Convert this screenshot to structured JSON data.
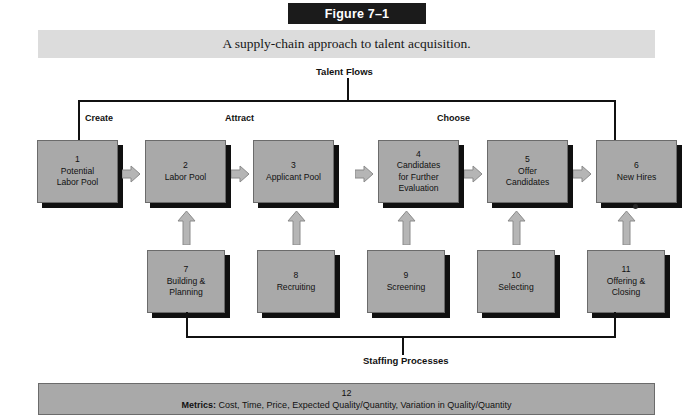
{
  "figure": {
    "title": "Figure 7–1",
    "caption": "A supply-chain approach to talent acquisition."
  },
  "brackets": {
    "top_label": "Talent Flows",
    "bottom_label": "Staffing Processes"
  },
  "phases": [
    {
      "id": "create",
      "label": "Create"
    },
    {
      "id": "attract",
      "label": "Attract"
    },
    {
      "id": "choose",
      "label": "Choose"
    }
  ],
  "flow_boxes": [
    {
      "num": "1",
      "name": "Potential\nLabor Pool"
    },
    {
      "num": "2",
      "name": "Labor Pool"
    },
    {
      "num": "3",
      "name": "Applicant Pool"
    },
    {
      "num": "4",
      "name": "Candidates\nfor Further\nEvaluation"
    },
    {
      "num": "5",
      "name": "Offer\nCandidates"
    },
    {
      "num": "6",
      "name": "New Hires"
    }
  ],
  "process_boxes": [
    {
      "num": "7",
      "name": "Building &\nPlanning"
    },
    {
      "num": "8",
      "name": "Recruiting"
    },
    {
      "num": "9",
      "name": "Screening"
    },
    {
      "num": "10",
      "name": "Selecting"
    },
    {
      "num": "11",
      "name": "Offering &\nClosing"
    }
  ],
  "metrics": {
    "num": "12",
    "label": "Metrics:",
    "text": " Cost, Time, Price, Expected Quality/Quantity, Variation in Quality/Quantity"
  },
  "colors": {
    "box_fill": "#a9a9a9",
    "box_shadow": "#101010",
    "title_bar": "#1b1b1b",
    "caption_band": "#dcdcdc",
    "line": "#111111"
  }
}
